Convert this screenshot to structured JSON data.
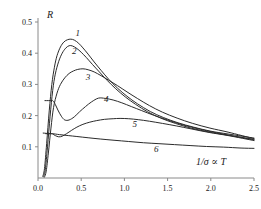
{
  "figure": {
    "name": "reflectance-vs-temperature-plot",
    "background_color": "#ffffff",
    "curve_color": "#2b2b2b",
    "axis_color": "#8a8a8a"
  },
  "chart_data": {
    "type": "line",
    "title": "",
    "subtitle": "",
    "xlabel": "1/σ ∝ T",
    "ylabel": "R",
    "xlim": [
      0.0,
      2.5
    ],
    "ylim": [
      0.0,
      0.5
    ],
    "grid": false,
    "legend_position": "inline-curve-labels",
    "xticks": [
      0.0,
      0.5,
      1.0,
      1.5,
      2.0,
      2.5
    ],
    "xticklabels": [
      "0.0",
      "0.5",
      "1.0",
      "1.5",
      "2.0",
      "2.5"
    ],
    "yticks": [
      0.1,
      0.2,
      0.3,
      0.4,
      0.5
    ],
    "yticklabels": [
      "0.1",
      "0.2",
      "0.3",
      "0.4",
      "0.5"
    ],
    "annotations": [
      {
        "text": "1",
        "x": 0.46,
        "y": 0.455
      },
      {
        "text": "2",
        "x": 0.42,
        "y": 0.398
      },
      {
        "text": "3",
        "x": 0.58,
        "y": 0.313
      },
      {
        "text": "4",
        "x": 0.79,
        "y": 0.243
      },
      {
        "text": "5",
        "x": 1.12,
        "y": 0.162
      },
      {
        "text": "6",
        "x": 1.37,
        "y": 0.082
      }
    ],
    "series": [
      {
        "name": "1",
        "label": "1",
        "peak_x": 0.38,
        "peak_y": 0.445,
        "end_y": 0.128,
        "x": [
          0.055,
          0.075,
          0.1,
          0.13,
          0.16,
          0.19,
          0.22,
          0.26,
          0.3,
          0.34,
          0.38,
          0.42,
          0.47,
          0.52,
          0.58,
          0.65,
          0.73,
          0.82,
          0.92,
          1.03,
          1.15,
          1.3,
          1.45,
          1.62,
          1.8,
          2.0,
          2.2,
          2.5
        ],
        "y": [
          0.005,
          0.03,
          0.11,
          0.215,
          0.3,
          0.355,
          0.392,
          0.42,
          0.436,
          0.443,
          0.445,
          0.442,
          0.432,
          0.417,
          0.397,
          0.372,
          0.345,
          0.316,
          0.288,
          0.262,
          0.238,
          0.213,
          0.194,
          0.177,
          0.163,
          0.15,
          0.141,
          0.128
        ]
      },
      {
        "name": "2",
        "label": "2",
        "peak_x": 0.36,
        "peak_y": 0.424,
        "end_y": 0.124,
        "x": [
          0.065,
          0.085,
          0.11,
          0.14,
          0.17,
          0.2,
          0.24,
          0.28,
          0.32,
          0.36,
          0.4,
          0.45,
          0.5,
          0.56,
          0.63,
          0.71,
          0.8,
          0.9,
          1.01,
          1.13,
          1.27,
          1.42,
          1.59,
          1.77,
          1.97,
          2.18,
          2.5
        ],
        "y": [
          0.004,
          0.028,
          0.1,
          0.198,
          0.28,
          0.333,
          0.374,
          0.4,
          0.416,
          0.424,
          0.423,
          0.415,
          0.403,
          0.386,
          0.364,
          0.34,
          0.313,
          0.286,
          0.26,
          0.236,
          0.212,
          0.192,
          0.175,
          0.16,
          0.148,
          0.138,
          0.124
        ]
      },
      {
        "name": "3",
        "label": "3",
        "peak_x": 0.52,
        "peak_y": 0.35,
        "end_y": 0.126,
        "plateau_y": 0.345,
        "x": [
          0.075,
          0.095,
          0.12,
          0.15,
          0.18,
          0.22,
          0.26,
          0.31,
          0.36,
          0.41,
          0.46,
          0.52,
          0.58,
          0.65,
          0.73,
          0.82,
          0.92,
          1.03,
          1.15,
          1.29,
          1.44,
          1.61,
          1.79,
          1.99,
          2.2,
          2.5
        ],
        "y": [
          0.003,
          0.022,
          0.08,
          0.16,
          0.226,
          0.272,
          0.3,
          0.321,
          0.335,
          0.343,
          0.348,
          0.35,
          0.347,
          0.34,
          0.328,
          0.313,
          0.296,
          0.276,
          0.255,
          0.232,
          0.211,
          0.192,
          0.175,
          0.16,
          0.147,
          0.126
        ]
      },
      {
        "name": "4",
        "label": "4",
        "peak_x": 0.7,
        "peak_y": 0.256,
        "end_y": 0.122,
        "plateau_y": 0.248,
        "plateau_x_end": 0.175,
        "x": [
          0.08,
          0.12,
          0.16,
          0.175,
          0.2,
          0.23,
          0.27,
          0.31,
          0.36,
          0.42,
          0.48,
          0.55,
          0.62,
          0.7,
          0.78,
          0.87,
          0.97,
          1.08,
          1.2,
          1.34,
          1.5,
          1.68,
          1.88,
          2.1,
          2.5
        ],
        "y": [
          0.248,
          0.248,
          0.248,
          0.247,
          0.236,
          0.218,
          0.198,
          0.186,
          0.186,
          0.196,
          0.212,
          0.229,
          0.244,
          0.256,
          0.255,
          0.25,
          0.241,
          0.229,
          0.216,
          0.201,
          0.186,
          0.17,
          0.156,
          0.143,
          0.122
        ]
      },
      {
        "name": "5",
        "label": "5",
        "peak_x": 0.95,
        "peak_y": 0.191,
        "end_y": 0.12,
        "plateau_y": 0.142,
        "plateau_x_end": 0.17,
        "x": [
          0.09,
          0.13,
          0.16,
          0.17,
          0.2,
          0.24,
          0.28,
          0.33,
          0.39,
          0.45,
          0.52,
          0.6,
          0.68,
          0.77,
          0.87,
          0.95,
          1.05,
          1.16,
          1.29,
          1.44,
          1.6,
          1.78,
          1.98,
          2.2,
          2.5
        ],
        "y": [
          0.142,
          0.142,
          0.142,
          0.141,
          0.136,
          0.132,
          0.134,
          0.142,
          0.153,
          0.163,
          0.172,
          0.179,
          0.184,
          0.188,
          0.19,
          0.191,
          0.19,
          0.187,
          0.182,
          0.175,
          0.167,
          0.157,
          0.146,
          0.136,
          0.12
        ]
      },
      {
        "name": "6",
        "label": "6",
        "peak_x": 0.17,
        "peak_y": 0.142,
        "end_y": 0.095,
        "monotonic": "slow-decay",
        "x": [
          0.06,
          0.1,
          0.14,
          0.17,
          0.25,
          0.35,
          0.45,
          0.58,
          0.72,
          0.88,
          1.05,
          1.22,
          1.4,
          1.58,
          1.76,
          1.95,
          2.15,
          2.35,
          2.5
        ],
        "y": [
          0.144,
          0.143,
          0.142,
          0.142,
          0.139,
          0.136,
          0.133,
          0.129,
          0.125,
          0.121,
          0.117,
          0.113,
          0.11,
          0.107,
          0.104,
          0.101,
          0.099,
          0.096,
          0.095
        ]
      }
    ]
  }
}
